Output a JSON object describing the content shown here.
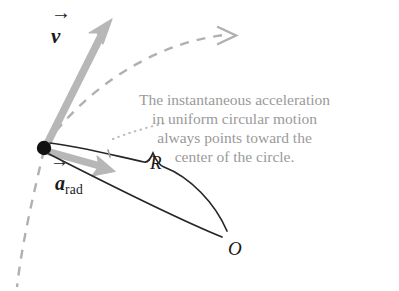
{
  "figure": {
    "type": "physics-vector-diagram",
    "background_color": "#ffffff",
    "annotation": {
      "lines": [
        "The instantaneous acceleration",
        "in uniform circular motion",
        "always points toward the",
        "center of the circle."
      ],
      "color": "#9a9a9a"
    },
    "labels": {
      "velocity": "v",
      "acceleration": "a",
      "acceleration_subscript": "rad",
      "radius": "R",
      "center": "O",
      "vector_accent": "→"
    },
    "colors": {
      "vector_gray": "#b3b3b3",
      "path_dash": "#b0b0b0",
      "leader_dot": "#bcbcbc",
      "line_black": "#262626",
      "particle": "#111111",
      "text_gray": "#9a9a9a",
      "text_black": "#1a1a1a"
    },
    "geometry": {
      "particle_point": [
        44,
        148
      ],
      "velocity_tip": [
        112,
        19
      ],
      "acceleration_tip": [
        112,
        171
      ],
      "center_point": [
        228,
        238
      ],
      "path_arrow_tip": [
        234,
        35
      ]
    }
  }
}
